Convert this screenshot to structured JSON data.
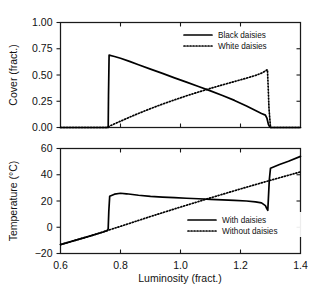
{
  "figure": {
    "panels": [
      "cover-panel",
      "temperature-panel"
    ]
  },
  "chart_data": [
    {
      "id": "cover-panel",
      "type": "line",
      "title": "",
      "xlabel": "",
      "ylabel": "Cover (fract.)",
      "xlim": [
        0.6,
        1.4
      ],
      "ylim": [
        0.0,
        1.0
      ],
      "xticks": [
        0.6,
        0.8,
        1.0,
        1.2,
        1.4
      ],
      "xticklabels": [
        "",
        "",
        "",
        "",
        ""
      ],
      "yticks": [
        0.0,
        0.25,
        0.5,
        0.75,
        1.0
      ],
      "yticklabels": [
        "0.00",
        "0.25",
        "0.50",
        "0.75",
        "1.00"
      ],
      "grid": false,
      "legend_position": "upper-right",
      "series": [
        {
          "name": "Black daisies",
          "style": "solid",
          "x": [
            0.6,
            0.66,
            0.7,
            0.74,
            0.757,
            0.759,
            0.76,
            0.762,
            0.78,
            0.8,
            0.83,
            0.86,
            0.9,
            0.94,
            0.98,
            1.02,
            1.06,
            1.1,
            1.14,
            1.18,
            1.22,
            1.25,
            1.27,
            1.283,
            1.288,
            1.291,
            1.293,
            1.296,
            1.3,
            1.33,
            1.36,
            1.4
          ],
          "values": [
            0.0,
            0.0,
            0.0,
            0.0,
            0.0,
            0.0,
            0.3,
            0.689,
            0.676,
            0.659,
            0.63,
            0.598,
            0.556,
            0.515,
            0.473,
            0.432,
            0.391,
            0.349,
            0.305,
            0.258,
            0.204,
            0.161,
            0.133,
            0.118,
            0.09,
            0.055,
            0.03,
            0.012,
            0.0,
            0.0,
            0.0,
            0.0
          ]
        },
        {
          "name": "White daisies",
          "style": "dotted",
          "x": [
            0.6,
            0.7,
            0.757,
            0.76,
            0.78,
            0.8,
            0.83,
            0.86,
            0.9,
            0.94,
            0.98,
            1.02,
            1.06,
            1.1,
            1.14,
            1.18,
            1.22,
            1.25,
            1.27,
            1.283,
            1.288,
            1.29,
            1.292,
            1.295,
            1.3,
            1.33,
            1.36,
            1.4
          ],
          "values": [
            0.0,
            0.0,
            0.0,
            0.009,
            0.035,
            0.06,
            0.098,
            0.134,
            0.18,
            0.223,
            0.263,
            0.302,
            0.338,
            0.373,
            0.406,
            0.438,
            0.47,
            0.496,
            0.518,
            0.538,
            0.549,
            0.551,
            0.4,
            0.18,
            0.0,
            0.0,
            0.0,
            0.0
          ]
        }
      ]
    },
    {
      "id": "temperature-panel",
      "type": "line",
      "title": "",
      "xlabel": "Luminosity (fract.)",
      "ylabel": "Temperature (°C)",
      "xlim": [
        0.6,
        1.4
      ],
      "ylim": [
        -20,
        60
      ],
      "xticks": [
        0.6,
        0.8,
        1.0,
        1.2,
        1.4
      ],
      "xticklabels": [
        "0.6",
        "0.8",
        "1.0",
        "1.2",
        "1.4"
      ],
      "yticks": [
        -20,
        0,
        20,
        40,
        60
      ],
      "yticklabels": [
        "−20",
        "0",
        "20",
        "40",
        "60"
      ],
      "grid": false,
      "legend_position": "lower-right",
      "series": [
        {
          "name": "With daisies",
          "style": "solid",
          "x": [
            0.6,
            0.66,
            0.7,
            0.74,
            0.757,
            0.759,
            0.761,
            0.764,
            0.78,
            0.8,
            0.82,
            0.86,
            0.9,
            0.94,
            0.98,
            1.02,
            1.06,
            1.1,
            1.14,
            1.18,
            1.22,
            1.25,
            1.27,
            1.283,
            1.288,
            1.291,
            1.293,
            1.296,
            1.3,
            1.33,
            1.36,
            1.4
          ],
          "values": [
            -13.2,
            -9.2,
            -6.6,
            -3.8,
            -2.4,
            -1.0,
            12.0,
            23.6,
            25.2,
            25.9,
            25.5,
            24.4,
            23.6,
            23.0,
            22.5,
            22.1,
            21.7,
            21.3,
            20.9,
            20.5,
            20.0,
            19.4,
            18.6,
            16.5,
            14.0,
            12.9,
            22.0,
            36.0,
            45.0,
            47.8,
            50.3,
            54.0
          ]
        },
        {
          "name": "Without daisies",
          "style": "dotted",
          "x": [
            0.6,
            0.7,
            0.757,
            0.8,
            0.9,
            1.0,
            1.1,
            1.2,
            1.3,
            1.4
          ],
          "values": [
            -13.2,
            -6.6,
            -2.4,
            0.7,
            8.2,
            15.4,
            22.4,
            29.2,
            35.8,
            42.2
          ]
        }
      ]
    }
  ],
  "cover_legend": [
    {
      "label": "Black daisies",
      "style": "solid"
    },
    {
      "label": "White daisies",
      "style": "dotted"
    }
  ],
  "temperature_legend": [
    {
      "label": "With daisies",
      "style": "solid"
    },
    {
      "label": "Without daisies",
      "style": "dotted"
    }
  ],
  "colors": {
    "line": "#000000",
    "axis": "#1a1a1a",
    "background": "#ffffff"
  }
}
